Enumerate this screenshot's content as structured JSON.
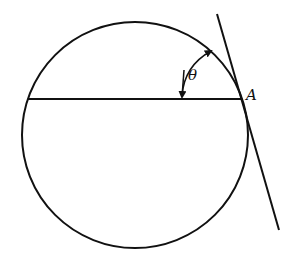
{
  "diagram": {
    "labels": {
      "point": "A",
      "angle": "θ"
    },
    "colors": {
      "stroke": "#111111",
      "background": "#ffffff"
    }
  }
}
